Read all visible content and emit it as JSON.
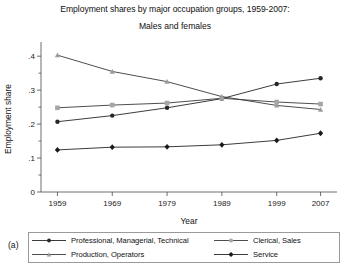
{
  "chart_data": {
    "type": "line",
    "title": "Employment shares by major occupation groups, 1959-2007:",
    "subtitle": "Males and females",
    "panel_label": "(a)",
    "xlabel": "Year",
    "ylabel": "Employment share",
    "x": [
      1959,
      1969,
      1979,
      1989,
      1999,
      2007
    ],
    "xticklabels": [
      "1959",
      "1969",
      "1979",
      "1989",
      "1999",
      "2007"
    ],
    "yticks": [
      0,
      0.1,
      0.2,
      0.3,
      0.4
    ],
    "yticklabels": [
      "0",
      ".1",
      ".2",
      ".3",
      ".4"
    ],
    "ylim": [
      0,
      0.43
    ],
    "xlim": [
      1956,
      2010
    ],
    "grid": false,
    "legend_position": "below-plot",
    "series": [
      {
        "name": "Professional, Managerial, Technical",
        "marker": "circle-filled",
        "color": "#262626",
        "marker_color": "#262626",
        "values": [
          0.207,
          0.225,
          0.248,
          0.275,
          0.318,
          0.335
        ]
      },
      {
        "name": "Clerical, Sales",
        "marker": "square-light",
        "color": "#3a3a3a",
        "marker_color": "#a6a6a6",
        "values": [
          0.248,
          0.256,
          0.262,
          0.276,
          0.265,
          0.259
        ]
      },
      {
        "name": "Production, Operators",
        "marker": "triangle-light",
        "color": "#3a3a3a",
        "marker_color": "#9c9c9c",
        "values": [
          0.403,
          0.355,
          0.325,
          0.281,
          0.255,
          0.243
        ]
      },
      {
        "name": "Service",
        "marker": "diamond-filled",
        "color": "#262626",
        "marker_color": "#1a1a1a",
        "values": [
          0.124,
          0.132,
          0.133,
          0.139,
          0.152,
          0.173
        ]
      }
    ]
  }
}
